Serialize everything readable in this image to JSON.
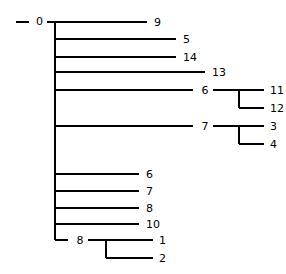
{
  "tree": {
    "label": "0",
    "children": [
      {
        "label": "9"
      },
      {
        "label": "5"
      },
      {
        "label": "14"
      },
      {
        "label": "13"
      },
      {
        "label": "6",
        "children": [
          {
            "label": "11"
          },
          {
            "label": "12"
          }
        ]
      },
      {
        "label": "7",
        "children": [
          {
            "label": "3"
          },
          {
            "label": "4"
          }
        ]
      },
      {
        "label": "6"
      },
      {
        "label": "7"
      },
      {
        "label": "8"
      },
      {
        "label": "10"
      },
      {
        "label": "8",
        "children": [
          {
            "label": "1"
          },
          {
            "label": "2"
          }
        ]
      }
    ]
  },
  "colors": {
    "line": "#000000",
    "text": "#000000",
    "background": "#ffffff"
  }
}
